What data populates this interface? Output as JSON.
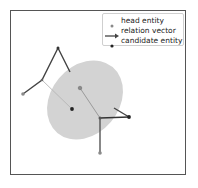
{
  "diagram": {
    "legend": {
      "items": [
        {
          "label": "head entity",
          "symbol": "dot",
          "color": "#8a8a8a"
        },
        {
          "label": "relation vector",
          "symbol": "arrow",
          "color": "#444444"
        },
        {
          "label": "candidate entity",
          "symbol": "dot",
          "color": "#222222"
        }
      ]
    },
    "colors": {
      "ellipse_fill": "#d3d3d3",
      "head_entity": "#8a8a8a",
      "candidate_entity": "#222222",
      "relation_line": "#444444",
      "thin_line": "#b0b0b0",
      "frame": "#555555"
    }
  }
}
